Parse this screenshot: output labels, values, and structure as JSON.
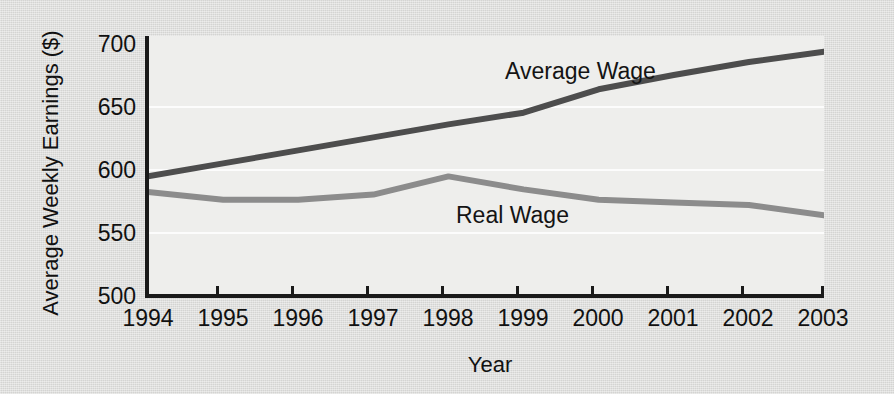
{
  "chart_data": {
    "type": "line",
    "title": "",
    "subtitle": "",
    "xlabel": "Year",
    "ylabel": "Average Weekly Earnings ($)",
    "categories": [
      "1994",
      "1995",
      "1996",
      "1997",
      "1998",
      "1999",
      "2000",
      "2001",
      "2002",
      "2003"
    ],
    "x": [
      1994,
      1995,
      1996,
      1997,
      1998,
      1999,
      2000,
      2001,
      2002,
      2003
    ],
    "xlim": [
      1994,
      2003
    ],
    "ylim": [
      500,
      700
    ],
    "ytick_labels": [
      "500",
      "550",
      "600",
      "650",
      "700"
    ],
    "yticks": [
      500,
      550,
      600,
      650,
      700
    ],
    "xtick_labels": [
      "1994",
      "1995",
      "1996",
      "1997",
      "1998",
      "1999",
      "2000",
      "2001",
      "2002",
      "2003"
    ],
    "grid": "horizontal-faint",
    "legend": "inline-annotations",
    "series": [
      {
        "name": "Average Wage",
        "color": "#4d4d4d",
        "values": [
          592,
          602,
          612,
          622,
          632,
          641,
          659,
          670,
          680,
          688
        ],
        "label_text": "Average Wage"
      },
      {
        "name": "Real Wage",
        "color": "#8c8c8c",
        "values": [
          580,
          574,
          574,
          578,
          592,
          582,
          574,
          572,
          570,
          562
        ],
        "label_text": "Real Wage"
      }
    ],
    "annotations": [
      {
        "text": "Average Wage",
        "series": "Average Wage"
      },
      {
        "text": "Real Wage",
        "series": "Real Wage"
      }
    ]
  },
  "colors": {
    "background": "#dcdcda",
    "plot_background": "#eeeeec",
    "axis": "#1a1a1a",
    "average_wage": "#4d4d4d",
    "real_wage": "#8c8c8c",
    "text": "#111111"
  }
}
